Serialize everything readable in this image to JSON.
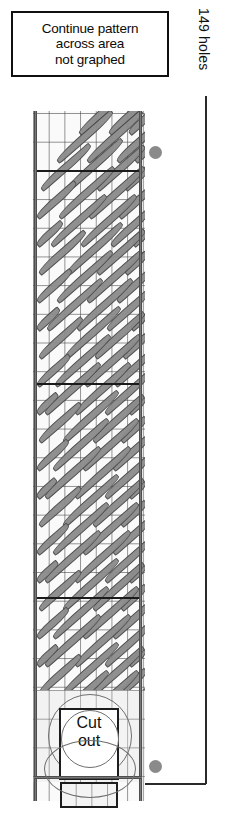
{
  "diagram": {
    "note": {
      "lines": [
        "Continue pattern",
        "across area",
        "not graphed"
      ]
    },
    "dimension_label": "149 holes",
    "cutout": {
      "lines": [
        "Cut",
        "out"
      ]
    },
    "colors": {
      "outline": "#1d1d1d",
      "grid_line": "#3c3c3c",
      "motif_fill": "#8c8c8c",
      "motif_stroke": "#4a4a4a",
      "dot": "#8a8a8a",
      "panel_bg": "#fafafa",
      "page_bg": "#ffffff"
    },
    "panel": {
      "columns": 7,
      "rows": 24,
      "dividers_y": [
        59,
        272,
        486
      ],
      "markers": [
        {
          "name": "top-registration-dot",
          "x": 149,
          "y": 146
        },
        {
          "name": "bottom-registration-dot",
          "x": 149,
          "y": 760
        }
      ]
    },
    "motifs": {
      "shape": "elongated-diagonal-leaf",
      "angle_deg": -41,
      "rows": [
        {
          "y": 18,
          "items": [
            {
              "x": 46,
              "len": 74
            },
            {
              "x": 76,
              "len": 52
            },
            {
              "x": 96,
              "len": 30
            }
          ]
        },
        {
          "y": 46,
          "items": [
            {
              "x": 24,
              "len": 74
            },
            {
              "x": 54,
              "len": 74
            },
            {
              "x": 84,
              "len": 46
            },
            {
              "x": 102,
              "len": 20
            }
          ]
        },
        {
          "y": 74,
          "items": [
            {
              "x": 8,
              "len": 66
            },
            {
              "x": 34,
              "len": 74
            },
            {
              "x": 64,
              "len": 64
            },
            {
              "x": 92,
              "len": 32
            }
          ]
        },
        {
          "y": 102,
          "items": [
            {
              "x": 4,
              "len": 52
            },
            {
              "x": 26,
              "len": 74
            },
            {
              "x": 56,
              "len": 74
            },
            {
              "x": 86,
              "len": 40
            }
          ]
        },
        {
          "y": 130,
          "items": [
            {
              "x": 4,
              "len": 34
            },
            {
              "x": 18,
              "len": 74
            },
            {
              "x": 48,
              "len": 74
            },
            {
              "x": 78,
              "len": 52
            },
            {
              "x": 100,
              "len": 18
            }
          ]
        },
        {
          "y": 158,
          "items": [
            {
              "x": 6,
              "len": 62
            },
            {
              "x": 34,
              "len": 74
            },
            {
              "x": 64,
              "len": 64
            },
            {
              "x": 92,
              "len": 30
            }
          ]
        },
        {
          "y": 186,
          "items": [
            {
              "x": 4,
              "len": 46
            },
            {
              "x": 24,
              "len": 74
            },
            {
              "x": 54,
              "len": 74
            },
            {
              "x": 84,
              "len": 44
            }
          ]
        },
        {
          "y": 214,
          "items": [
            {
              "x": 4,
              "len": 30
            },
            {
              "x": 14,
              "len": 74
            },
            {
              "x": 44,
              "len": 74
            },
            {
              "x": 74,
              "len": 56
            },
            {
              "x": 98,
              "len": 20
            }
          ]
        },
        {
          "y": 242,
          "items": [
            {
              "x": 6,
              "len": 58
            },
            {
              "x": 32,
              "len": 74
            },
            {
              "x": 62,
              "len": 66
            },
            {
              "x": 90,
              "len": 32
            }
          ]
        },
        {
          "y": 270,
          "items": [
            {
              "x": 4,
              "len": 44
            },
            {
              "x": 22,
              "len": 74
            },
            {
              "x": 52,
              "len": 74
            },
            {
              "x": 82,
              "len": 46
            }
          ]
        },
        {
          "y": 298,
          "items": [
            {
              "x": 4,
              "len": 28
            },
            {
              "x": 12,
              "len": 74
            },
            {
              "x": 42,
              "len": 74
            },
            {
              "x": 72,
              "len": 58
            },
            {
              "x": 96,
              "len": 22
            }
          ]
        },
        {
          "y": 326,
          "items": [
            {
              "x": 6,
              "len": 56
            },
            {
              "x": 30,
              "len": 74
            },
            {
              "x": 60,
              "len": 68
            },
            {
              "x": 88,
              "len": 34
            }
          ]
        },
        {
          "y": 354,
          "items": [
            {
              "x": 4,
              "len": 42
            },
            {
              "x": 20,
              "len": 74
            },
            {
              "x": 50,
              "len": 74
            },
            {
              "x": 80,
              "len": 48
            }
          ]
        },
        {
          "y": 382,
          "items": [
            {
              "x": 4,
              "len": 26
            },
            {
              "x": 12,
              "len": 74
            },
            {
              "x": 42,
              "len": 74
            },
            {
              "x": 72,
              "len": 58
            },
            {
              "x": 96,
              "len": 22
            }
          ]
        },
        {
          "y": 410,
          "items": [
            {
              "x": 6,
              "len": 56
            },
            {
              "x": 30,
              "len": 74
            },
            {
              "x": 60,
              "len": 68
            },
            {
              "x": 88,
              "len": 34
            }
          ]
        },
        {
          "y": 438,
          "items": [
            {
              "x": 4,
              "len": 42
            },
            {
              "x": 20,
              "len": 74
            },
            {
              "x": 50,
              "len": 74
            },
            {
              "x": 80,
              "len": 48
            }
          ]
        },
        {
          "y": 466,
          "items": [
            {
              "x": 4,
              "len": 28
            },
            {
              "x": 12,
              "len": 74
            },
            {
              "x": 42,
              "len": 74
            },
            {
              "x": 72,
              "len": 58
            },
            {
              "x": 96,
              "len": 22
            }
          ]
        },
        {
          "y": 494,
          "items": [
            {
              "x": 6,
              "len": 56
            },
            {
              "x": 30,
              "len": 74
            },
            {
              "x": 60,
              "len": 68
            },
            {
              "x": 88,
              "len": 34
            }
          ]
        },
        {
          "y": 522,
          "items": [
            {
              "x": 4,
              "len": 42
            },
            {
              "x": 20,
              "len": 74
            },
            {
              "x": 50,
              "len": 74
            },
            {
              "x": 80,
              "len": 48
            }
          ]
        },
        {
          "y": 550,
          "items": [
            {
              "x": 4,
              "len": 28
            },
            {
              "x": 12,
              "len": 74
            },
            {
              "x": 42,
              "len": 74
            },
            {
              "x": 72,
              "len": 58
            },
            {
              "x": 96,
              "len": 22
            }
          ]
        },
        {
          "y": 578,
          "items": [
            {
              "x": 6,
              "len": 56
            },
            {
              "x": 30,
              "len": 74
            },
            {
              "x": 60,
              "len": 68
            },
            {
              "x": 88,
              "len": 34
            }
          ]
        },
        {
          "y": 606,
          "items": [
            {
              "x": 4,
              "len": 42
            },
            {
              "x": 20,
              "len": 74
            },
            {
              "x": 50,
              "len": 74
            },
            {
              "x": 80,
              "len": 48
            }
          ]
        },
        {
          "y": 634,
          "items": [
            {
              "x": 4,
              "len": 28
            },
            {
              "x": 12,
              "len": 74
            },
            {
              "x": 42,
              "len": 74
            },
            {
              "x": 72,
              "len": 58
            },
            {
              "x": 96,
              "len": 22
            }
          ]
        },
        {
          "y": 662,
          "items": [
            {
              "x": 8,
              "len": 48
            },
            {
              "x": 34,
              "len": 60
            },
            {
              "x": 62,
              "len": 52
            },
            {
              "x": 88,
              "len": 24
            }
          ]
        }
      ]
    }
  }
}
